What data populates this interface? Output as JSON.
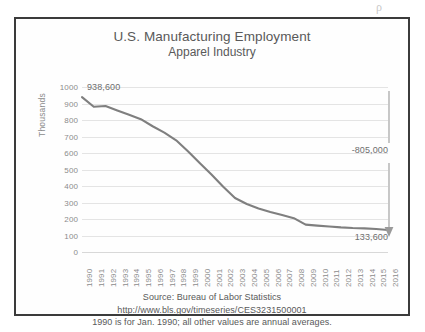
{
  "figure": {
    "scan_artifact_glyph": "ρ"
  },
  "chart_data": {
    "type": "line",
    "title": "U.S. Manufacturing Employment",
    "subtitle": "Apparel Industry",
    "xlabel": "",
    "ylabel": "Thousands",
    "ylim": [
      0,
      1000
    ],
    "ytick_step": 100,
    "grid": true,
    "legend": "none",
    "series_color": "#7f7f7f",
    "categories": [
      "1990",
      "1991",
      "1992",
      "1993",
      "1994",
      "1995",
      "1996",
      "1997",
      "1998",
      "1999",
      "2000",
      "2001",
      "2002",
      "2003",
      "2004",
      "2005",
      "2006",
      "2007",
      "2008",
      "2009",
      "2010",
      "2011",
      "2012",
      "2013",
      "2014",
      "2015",
      "2016"
    ],
    "yticks": [
      "1000",
      "900",
      "800",
      "700",
      "600",
      "500",
      "400",
      "300",
      "200",
      "100",
      "0"
    ],
    "series": [
      {
        "name": "Apparel manufacturing employment (thousands)",
        "values": [
          938.6,
          880.0,
          885.0,
          858.0,
          832.0,
          805.0,
          762.0,
          723.0,
          677.0,
          611.0,
          540.0,
          470.0,
          395.0,
          327.0,
          291.0,
          264.0,
          243.0,
          224.0,
          205.0,
          166.0,
          160.0,
          155.0,
          149.0,
          145.0,
          143.0,
          139.0,
          133.6
        ]
      }
    ],
    "annotations": [
      {
        "name": "start-value",
        "text": "938,600",
        "at_category": "1990",
        "value": 938.6
      },
      {
        "name": "end-value",
        "text": "133,600",
        "at_category": "2016",
        "value": 133.6
      },
      {
        "name": "change-value",
        "text": "-805,000",
        "from": 938.6,
        "to": 133.6
      }
    ]
  },
  "source": {
    "line1": "Source:  Bureau of Labor Statistics",
    "line2": "http://www.bls.gov/timeseries/CES3231500001",
    "line3": "1990 is for Jan. 1990; all other values are annual averages."
  }
}
